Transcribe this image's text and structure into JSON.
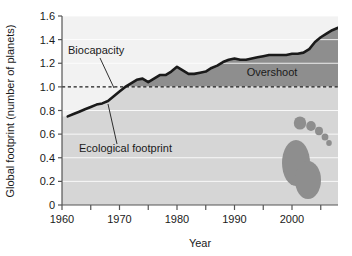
{
  "chart_data": {
    "type": "area",
    "title": "",
    "subtitle": "",
    "xlabel": "Year",
    "ylabel": "Global footprint (number of planets)",
    "xlim": [
      1960,
      2008
    ],
    "ylim": [
      0,
      1.6
    ],
    "grid": true,
    "legend_position": "none",
    "x_ticks_major": [
      1960,
      1970,
      1980,
      1990,
      2000
    ],
    "x_ticks_minor": [
      1965,
      1975,
      1985,
      1995,
      2005
    ],
    "y_ticks": [
      0,
      0.2,
      0.4,
      0.6,
      0.8,
      1.0,
      1.2,
      1.4,
      1.6
    ],
    "y_tick_labels": [
      "0",
      "0.2",
      "0.4",
      "0.6",
      "0.8",
      "1.0",
      "1.2",
      "1.4",
      "1.6"
    ],
    "x_tick_labels": [
      "1960",
      "1970",
      "1980",
      "1990",
      "2000"
    ],
    "annotations": [
      {
        "name": "biocapacity",
        "text": "Biocapacity",
        "points_to": "dashed line at 1.0"
      },
      {
        "name": "ecological-footprint",
        "text": "Ecological footprint",
        "points_to": "footprint curve"
      },
      {
        "name": "overshoot",
        "text": "Overshoot",
        "points_to": "shaded region between curve and 1.0"
      }
    ],
    "series": [
      {
        "name": "Ecological footprint",
        "x": [
          1961,
          1962,
          1963,
          1964,
          1965,
          1966,
          1967,
          1968,
          1969,
          1970,
          1971,
          1972,
          1973,
          1974,
          1975,
          1976,
          1977,
          1978,
          1979,
          1980,
          1981,
          1982,
          1983,
          1984,
          1985,
          1986,
          1987,
          1988,
          1989,
          1990,
          1991,
          1992,
          1993,
          1994,
          1995,
          1996,
          1997,
          1998,
          1999,
          2000,
          2001,
          2002,
          2003,
          2004,
          2005,
          2006,
          2007,
          2008
        ],
        "values": [
          0.75,
          0.77,
          0.79,
          0.81,
          0.83,
          0.85,
          0.86,
          0.88,
          0.92,
          0.96,
          1.0,
          1.03,
          1.06,
          1.07,
          1.04,
          1.07,
          1.1,
          1.1,
          1.13,
          1.17,
          1.14,
          1.11,
          1.11,
          1.12,
          1.13,
          1.16,
          1.18,
          1.21,
          1.23,
          1.24,
          1.23,
          1.23,
          1.24,
          1.25,
          1.26,
          1.27,
          1.27,
          1.27,
          1.27,
          1.28,
          1.28,
          1.29,
          1.32,
          1.38,
          1.42,
          1.45,
          1.48,
          1.5
        ]
      },
      {
        "name": "Biocapacity",
        "style": "dashed",
        "constant_value": 1.0
      }
    ],
    "colors": {
      "overshoot_fill": "#8e8e8e",
      "below_curve_fill": "#d6d6d6",
      "above_curve_fill": "#f2f2f2",
      "footprint_line": "#1a1a1a",
      "biocapacity_line": "#1a1a1a",
      "gridline": "#ffffff",
      "axis": "#555555",
      "footprint_icon": "#8e8e8e"
    }
  },
  "icons": {
    "footprint": "footprint-icon"
  }
}
